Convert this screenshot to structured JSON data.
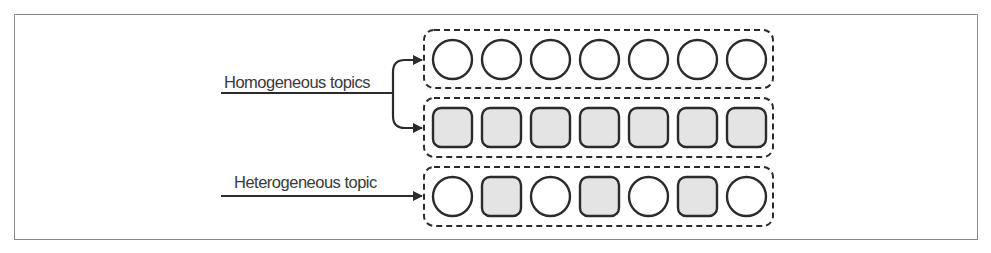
{
  "diagram": {
    "labels": {
      "homogeneous": "Homogeneous topics",
      "heterogeneous": "Heterogeneous topic"
    },
    "colors": {
      "stroke": "#2b2b2b",
      "fill_gray": "#e4e4e4",
      "frame": "#8a8a8a"
    },
    "rows": [
      {
        "name": "homogeneous-circles",
        "items": [
          "circle",
          "circle",
          "circle",
          "circle",
          "circle",
          "circle",
          "circle"
        ]
      },
      {
        "name": "homogeneous-squares",
        "items": [
          "square",
          "square",
          "square",
          "square",
          "square",
          "square",
          "square"
        ]
      },
      {
        "name": "heterogeneous-mixed",
        "items": [
          "circle",
          "square",
          "circle",
          "square",
          "circle",
          "square",
          "circle"
        ]
      }
    ]
  }
}
